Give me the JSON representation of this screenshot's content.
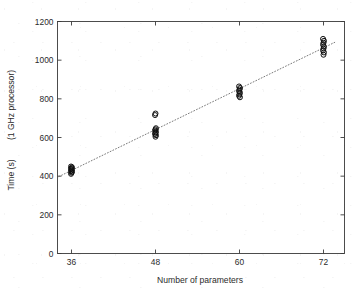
{
  "figure": {
    "background_color": "#ffffff",
    "axes_color": "#3a3a3a",
    "marker_color": "#101010",
    "fit_line_color": "#6b6b6b"
  },
  "chart_data": {
    "type": "scatter",
    "title": "",
    "xlabel": "Number of parameters",
    "ylabel": "Time (s)   (1 GHz processor)",
    "ylabel_parts": [
      "Time (s)",
      "(1 GHz processor)"
    ],
    "xlim": [
      34,
      75
    ],
    "ylim": [
      0,
      1200
    ],
    "xticks": [
      36,
      48,
      60,
      72
    ],
    "xtick_labels": [
      "36",
      "48",
      "60",
      "72"
    ],
    "yticks": [
      0,
      200,
      400,
      600,
      800,
      1000,
      1200
    ],
    "ytick_labels": [
      "0",
      "200",
      "400",
      "600",
      "800",
      "1000",
      "1200"
    ],
    "grid": false,
    "legend": null,
    "marker": "circle-open",
    "series": [
      {
        "name": "Measured runtime",
        "points": [
          {
            "x": 36,
            "y": 412
          },
          {
            "x": 36,
            "y": 418
          },
          {
            "x": 36,
            "y": 422
          },
          {
            "x": 36,
            "y": 426
          },
          {
            "x": 36,
            "y": 430
          },
          {
            "x": 36,
            "y": 434
          },
          {
            "x": 36,
            "y": 438
          },
          {
            "x": 36,
            "y": 442
          },
          {
            "x": 36,
            "y": 446
          },
          {
            "x": 36,
            "y": 450
          },
          {
            "x": 48,
            "y": 604
          },
          {
            "x": 48,
            "y": 612
          },
          {
            "x": 48,
            "y": 618
          },
          {
            "x": 48,
            "y": 624
          },
          {
            "x": 48,
            "y": 630
          },
          {
            "x": 48,
            "y": 636
          },
          {
            "x": 48,
            "y": 642
          },
          {
            "x": 48,
            "y": 648
          },
          {
            "x": 48,
            "y": 716
          },
          {
            "x": 48,
            "y": 724
          },
          {
            "x": 60,
            "y": 808
          },
          {
            "x": 60,
            "y": 816
          },
          {
            "x": 60,
            "y": 824
          },
          {
            "x": 60,
            "y": 832
          },
          {
            "x": 60,
            "y": 840
          },
          {
            "x": 60,
            "y": 848
          },
          {
            "x": 60,
            "y": 856
          },
          {
            "x": 60,
            "y": 864
          },
          {
            "x": 72,
            "y": 1028
          },
          {
            "x": 72,
            "y": 1040
          },
          {
            "x": 72,
            "y": 1050
          },
          {
            "x": 72,
            "y": 1060
          },
          {
            "x": 72,
            "y": 1070
          },
          {
            "x": 72,
            "y": 1080
          },
          {
            "x": 72,
            "y": 1090
          },
          {
            "x": 72,
            "y": 1100
          },
          {
            "x": 72,
            "y": 1110
          }
        ]
      }
    ],
    "fit_line": {
      "name": "Linear fit",
      "style": "dotted",
      "x": [
        34.2,
        73.6
      ],
      "y": [
        398,
        1092
      ]
    }
  }
}
